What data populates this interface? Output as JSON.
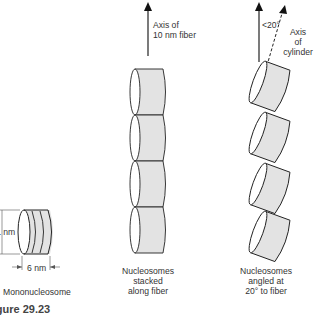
{
  "figure": {
    "caption": "Figure 29.23",
    "panels": [
      {
        "id": "mononucleosome",
        "label": "Mononucleosome",
        "dimensions": {
          "height_label": "11 nm",
          "width_label": "6 nm"
        }
      },
      {
        "id": "stacked",
        "axis_label_line1": "Axis of",
        "axis_label_line2": "10 nm fiber",
        "label_line1": "Nucleosomes",
        "label_line2": "stacked",
        "label_line3": "along fiber",
        "count": 4
      },
      {
        "id": "angled",
        "angle_label": "<20°",
        "axis_label_line1": "Axis",
        "axis_label_line2": "of",
        "axis_label_line3": "cylinder",
        "label_line1": "Nucleosomes",
        "label_line2": "angled at",
        "label_line3": "20° to fiber",
        "count": 4
      }
    ]
  },
  "colors": {
    "fill": "#e3e3e3",
    "stroke": "#222222",
    "text": "#333333"
  }
}
